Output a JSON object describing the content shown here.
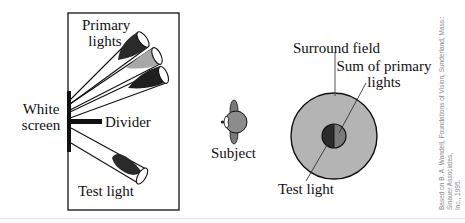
{
  "apparatus": {
    "primary_lights_label_1": "Primary",
    "primary_lights_label_2": "lights",
    "white_screen_label_1": "White",
    "white_screen_label_2": "screen",
    "divider_label": "Divider",
    "test_light_label": "Test light"
  },
  "subject": {
    "label": "Subject"
  },
  "field": {
    "surround_label": "Surround field",
    "sum_label_1": "Sum of primary",
    "sum_label_2": "lights",
    "test_light_label": "Test light"
  },
  "credit": {
    "line1": "Based on B. A. Wandell, Foundations of Vision, Sunderland, Mass.: Sinauer Associates,",
    "line2": "Inc., 1995."
  },
  "colors": {
    "surround_fill": "#b4b4b4",
    "primary_dark": "#2a2a2a",
    "primary_light": "#a8a8a8",
    "test_half": "#2b2b2b",
    "sum_half": "#7a7a7a",
    "outline": "#111111"
  }
}
